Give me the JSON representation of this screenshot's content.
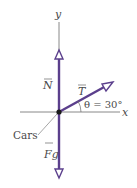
{
  "diagram": {
    "type": "free-body diagram",
    "axes": {
      "x_label": "x",
      "y_label": "y"
    },
    "object_label": "Cars",
    "vectors": [
      {
        "name": "N",
        "label": "N",
        "direction": "up"
      },
      {
        "name": "T",
        "label": "T",
        "direction": "30° above +x"
      },
      {
        "name": "Fg",
        "label": "Fg",
        "direction": "down"
      }
    ],
    "angle_label": "θ = 30°",
    "colors": {
      "vector": "#5b3f8c",
      "axis": "#6a6a6a",
      "text": "#4a4a4a"
    }
  }
}
